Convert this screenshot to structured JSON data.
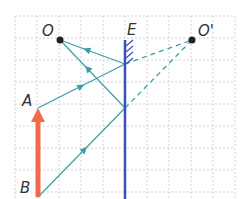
{
  "diagram": {
    "type": "plane-mirror-ray-diagram",
    "labels": {
      "object_point": "O",
      "mirror": "E",
      "image_point": "O'",
      "arrow_top": "A",
      "arrow_bottom": "B"
    },
    "colors": {
      "grid": "#c8c8c8",
      "mirror": "#3a4fb8",
      "ray": "#3a9fa6",
      "arrow": "#f26a4b",
      "point": "#222222",
      "label": "#333333"
    },
    "grid": {
      "x0": 15,
      "y0": 16,
      "spacing": 22,
      "cols": 10,
      "rows": 9
    },
    "points": {
      "O": [
        60,
        40
      ],
      "O_prime": [
        192,
        40
      ],
      "A": [
        38,
        108
      ],
      "B": [
        38,
        197
      ],
      "I1": [
        125,
        64
      ],
      "I2": [
        125,
        108
      ]
    },
    "mirror": {
      "x": 125,
      "y1": 40,
      "y2": 199
    }
  }
}
